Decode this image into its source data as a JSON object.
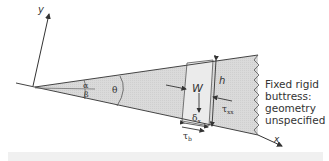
{
  "diagram": {
    "type": "wedge force-balance schematic",
    "axes": {
      "x_label": "x",
      "y_label": "y"
    },
    "angles": {
      "alpha": "α",
      "beta": "β",
      "theta": "θ"
    },
    "forces": {
      "weight": "W",
      "height": "h",
      "width": "δ",
      "width_sub": "x",
      "lateral_stress": "τ",
      "lateral_stress_sub": "xx",
      "basal_stress": "τ",
      "basal_stress_sub": "b"
    },
    "buttress_caption": [
      "Fixed rigid",
      "buttress:",
      "geometry",
      "unspecified"
    ],
    "colors": {
      "wedge_fill": "#d9d9d9",
      "column_fill": "#ebebeb",
      "line": "#444444",
      "bottom_strip": "#f0f0f0"
    }
  }
}
